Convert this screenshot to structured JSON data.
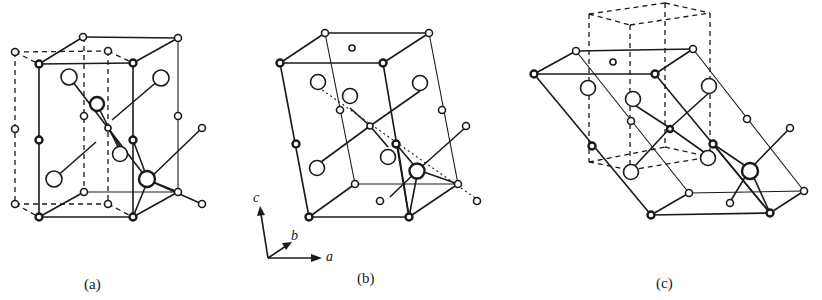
{
  "figure": {
    "panels": [
      {
        "id": "a",
        "caption": "(a)"
      },
      {
        "id": "b",
        "caption": "(b)"
      },
      {
        "id": "c",
        "caption": "(c)"
      }
    ],
    "axes": {
      "c": "c",
      "b": "b",
      "a": "a"
    }
  }
}
